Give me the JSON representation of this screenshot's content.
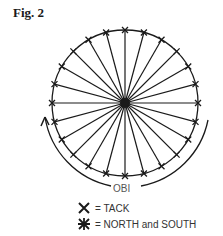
{
  "figure": {
    "title": "Fig. 2",
    "center_label": "OBI",
    "spoke_count": 24,
    "legend": [
      {
        "symbol": "x-mark-icon",
        "label": "= TACK"
      },
      {
        "symbol": "asterisk-star-icon",
        "label": "= NORTH and SOUTH"
      }
    ],
    "colors": {
      "ink": "#1a1a1a",
      "background": "#ffffff"
    }
  }
}
